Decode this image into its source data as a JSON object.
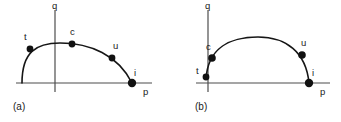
{
  "figure": {
    "background_color": "#ffffff",
    "stroke_color": "#161616",
    "axis_color": "#4d4d4d",
    "marker_color": "#111111",
    "width": 341,
    "height": 122
  },
  "panels": [
    {
      "id": "a",
      "caption": "(a)",
      "axes": {
        "x_axis_label": "p",
        "y_axis_label": "q",
        "x_axis_start": 16,
        "x_axis_end": 152,
        "x_axis_y": 83,
        "y_axis_x": 55,
        "y_axis_top": 10,
        "y_axis_bottom": 92
      },
      "curve": {
        "path": "M 22,83 C 22,52 36,43 60,43 C 90,43 118,55 132,83",
        "description": "arc rising from p-axis at left, peaking left of center, descending to p-axis at right"
      },
      "points": [
        {
          "name": "t",
          "label": "t",
          "x": 30,
          "y": 49,
          "label_x": 24,
          "label_y": 40,
          "radius": 3.4
        },
        {
          "name": "c",
          "label": "c",
          "x": 72,
          "y": 44,
          "label_x": 70,
          "label_y": 35,
          "radius": 3.4
        },
        {
          "name": "u",
          "label": "u",
          "x": 112,
          "y": 58,
          "label_x": 113,
          "label_y": 49,
          "radius": 3.4
        },
        {
          "name": "i",
          "label": "i",
          "x": 132,
          "y": 83,
          "label_x": 134,
          "label_y": 76,
          "radius": 4.2
        }
      ],
      "axis_label_positions": {
        "x_label_x": 143,
        "x_label_y": 95,
        "y_label_x": 52,
        "y_label_y": 9
      }
    },
    {
      "id": "b",
      "caption": "(b)",
      "axes": {
        "x_axis_label": "p",
        "y_axis_label": "q",
        "x_axis_start": 26,
        "x_axis_end": 160,
        "x_axis_y": 83,
        "y_axis_x": 38,
        "y_axis_top": 10,
        "y_axis_bottom": 92
      },
      "curve": {
        "path": "M 36,79 C 38,48 60,37 88,37 C 116,37 136,52 139,83",
        "description": "arc rising steeply from near the q-axis, broad symmetric dome, descending to p-axis at right"
      },
      "points": [
        {
          "name": "t",
          "label": "t",
          "x": 36,
          "y": 77,
          "label_x": 26,
          "label_y": 74,
          "radius": 3.4
        },
        {
          "name": "c",
          "label": "c",
          "x": 42,
          "y": 58,
          "label_x": 36,
          "label_y": 50,
          "radius": 3.8
        },
        {
          "name": "u",
          "label": "u",
          "x": 132,
          "y": 55,
          "label_x": 131,
          "label_y": 46,
          "radius": 3.8
        },
        {
          "name": "i",
          "label": "i",
          "x": 139,
          "y": 83,
          "label_x": 142,
          "label_y": 76,
          "radius": 4.2
        }
      ],
      "axis_label_positions": {
        "x_label_x": 150,
        "x_label_y": 95,
        "y_label_x": 35,
        "y_label_y": 9
      }
    }
  ]
}
